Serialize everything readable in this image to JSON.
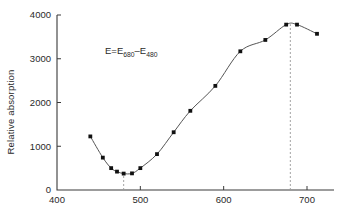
{
  "chart_data": {
    "type": "scatter",
    "title": "",
    "subtitle": "",
    "xlabel": "",
    "ylabel": "Relative absorption",
    "xlim": [
      400,
      730
    ],
    "ylim": [
      0,
      4000
    ],
    "grid": false,
    "legend": null,
    "xticks": [
      400,
      500,
      600,
      700
    ],
    "xticklabels": [
      "400",
      "500",
      "600",
      "700"
    ],
    "yticks": [
      0,
      1000,
      2000,
      3000,
      4000
    ],
    "yticklabels": [
      "0",
      "1000",
      "2000",
      "3000",
      "4000"
    ],
    "series": [
      {
        "name": "Relative absorption",
        "marker": "filled-square",
        "line": "smooth-fitted-curve",
        "x": [
          440,
          455,
          465,
          472,
          480,
          490,
          500,
          520,
          540,
          560,
          590,
          620,
          650,
          675,
          688,
          712
        ],
        "y": [
          1225,
          740,
          500,
          420,
          375,
          380,
          500,
          820,
          1320,
          1810,
          2380,
          3170,
          3430,
          3780,
          3780,
          3570
        ]
      }
    ],
    "annotations": [
      {
        "name": "formula",
        "text": "E=E680-E480",
        "parts": [
          "E=E",
          "680",
          "-E",
          "480"
        ],
        "x": 495,
        "y": 3350
      }
    ],
    "reference_lines": [
      {
        "name": "minimum-marker",
        "orientation": "vertical",
        "x": 480,
        "style": "dashed",
        "from_y": 0,
        "to_y": 375
      },
      {
        "name": "maximum-marker",
        "orientation": "vertical",
        "x": 680,
        "style": "dashed",
        "from_y": 0,
        "to_y": 3790
      }
    ],
    "colors": {
      "marker": "#111111",
      "curve": "#555555",
      "axis": "#3a3a3a",
      "guide": "#9a9a9a",
      "background": "#ffffff"
    }
  },
  "axis": {
    "y_title": "Relative absorption",
    "x_tick_labels": [
      "400",
      "500",
      "600",
      "700"
    ],
    "y_tick_labels": [
      "0",
      "1000",
      "2000",
      "3000",
      "4000"
    ]
  },
  "annotation": {
    "formula_lead": "E=E",
    "formula_sub1": "680",
    "formula_mid": "–E",
    "formula_sub2": "480"
  }
}
